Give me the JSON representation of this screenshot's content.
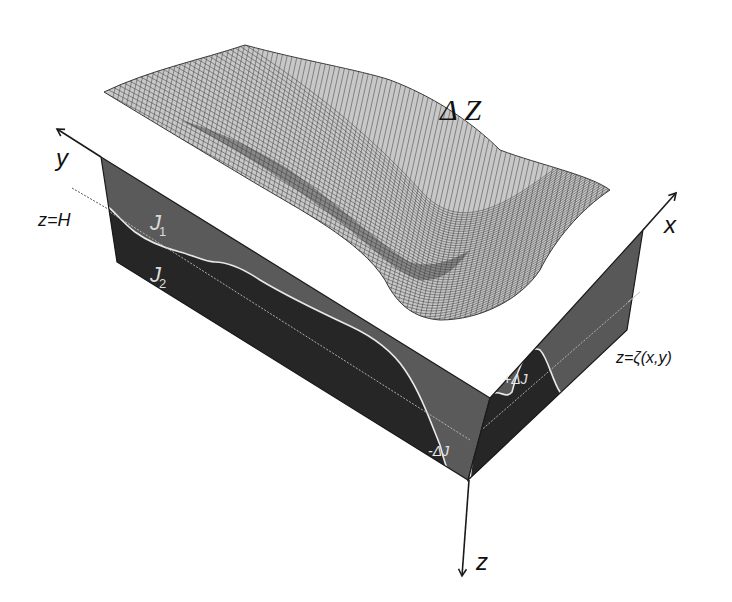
{
  "figure": {
    "surface_label": "Δ Z",
    "axes": {
      "x_label": "x",
      "y_label": "y",
      "z_label": "z"
    },
    "layer_labels": {
      "upper_layer": "J",
      "upper_layer_subscript": "1",
      "lower_layer": "J",
      "lower_layer_subscript": "2"
    },
    "level_labels": {
      "reference_depth": "z=H",
      "interface": "z=ζ(x,y)"
    },
    "perturbation_labels": {
      "positive": "+ΔJ",
      "negative": "-ΔJ"
    },
    "colors": {
      "background": "#ffffff",
      "upper_layer_fill": "#5a5a5a",
      "lower_layer_fill": "#262626",
      "interface_curve": "#e8e8e8",
      "mesh_line": "#444444",
      "axis_line": "#1a1a1a"
    }
  }
}
